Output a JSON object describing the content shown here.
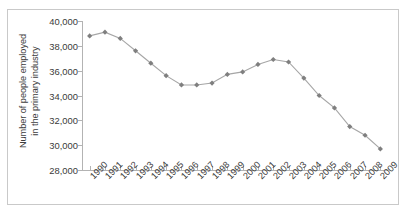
{
  "chart_data": {
    "type": "line",
    "title": "",
    "subtitle": "",
    "xlabel": "",
    "ylabel": "Number of people employed in the primary industry",
    "ylabel_lines": [
      "Number of people employed",
      "in the primary industry"
    ],
    "categories": [
      "1990",
      "1991",
      "1992",
      "1993",
      "1994",
      "1995",
      "1996",
      "1997",
      "1998",
      "1999",
      "2000",
      "2001",
      "2002",
      "2003",
      "2004",
      "2005",
      "2006",
      "2007",
      "2008",
      "2009"
    ],
    "values": [
      38800,
      39100,
      38600,
      37600,
      36600,
      35600,
      34850,
      34850,
      35000,
      35700,
      35900,
      36500,
      36900,
      36700,
      35400,
      34000,
      33000,
      31500,
      30800,
      29700
    ],
    "series": [
      {
        "name": "Number of people employed in the primary industry",
        "values": [
          38800,
          39100,
          38600,
          37600,
          36600,
          35600,
          34850,
          34850,
          35000,
          35700,
          35900,
          36500,
          36900,
          36700,
          35400,
          34000,
          33000,
          31500,
          30800,
          29700
        ]
      }
    ],
    "ylim": [
      28000,
      40000
    ],
    "ytick_labels": [
      "40,000",
      "38,000",
      "36,000",
      "34,000",
      "32,000",
      "30,000",
      "28,000"
    ],
    "ytick_values": [
      40000,
      38000,
      36000,
      34000,
      32000,
      30000,
      28000
    ],
    "ytick_step": 2000,
    "grid": false,
    "legend": false,
    "legend_position": "none",
    "marker": "diamond",
    "line_color": "#a6a6a6",
    "marker_color": "#7f7f7f",
    "axis_color": "#b3b3b3",
    "border_color": "#c9c9c9",
    "text_color": "#3a3a3a",
    "background": "#ffffff"
  }
}
